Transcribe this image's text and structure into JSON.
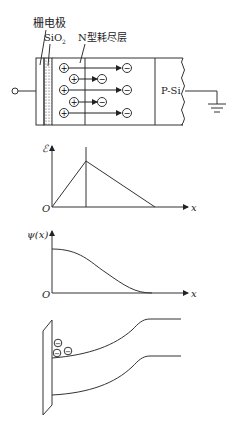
{
  "figure": {
    "device": {
      "gate_label": "栅电极",
      "oxide_label": "SiO",
      "oxide_subscript": "2",
      "depletion_label": "N型耗尽层",
      "substrate_label": "P-Si",
      "positive_symbol": "+",
      "negative_symbol": "−",
      "rows": [
        {
          "from": "+",
          "to": "−",
          "length": "long"
        },
        {
          "from": "+",
          "to": "−",
          "length": "short"
        },
        {
          "from": "+",
          "to": "−",
          "length": "long"
        },
        {
          "from": "+",
          "to": "−",
          "length": "short"
        },
        {
          "from": "+",
          "to": "−",
          "length": "long"
        }
      ],
      "terminals": [
        "input-terminal",
        "ground-symbol"
      ]
    },
    "field_plot": {
      "ylabel": "ℰ",
      "xlabel": "x",
      "origin": "O",
      "shape": "triangle peaking at oxide/semiconductor boundary then linearly decreasing to zero"
    },
    "potential_plot": {
      "ylabel": "ψ(x)",
      "xlabel": "x",
      "origin": "O",
      "shape": "monotonically decreasing S-curve from maximum at surface to zero"
    },
    "band_diagram": {
      "electron_count": 3,
      "electron_symbol": "−"
    }
  }
}
